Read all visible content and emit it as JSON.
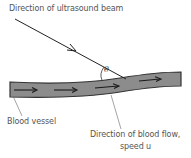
{
  "labels": {
    "beam": "Direction of ultrasound beam",
    "angle": "θ",
    "vessel": "Blood vessel",
    "flow_line1": "Direction of blood flow,",
    "flow_line2": "speed u"
  },
  "colors": {
    "vessel_fill": "#8c8c8c",
    "vessel_edge": "#333333",
    "arrow": "#1a1a1a",
    "beam": "#222222",
    "label_text": "#555555"
  }
}
